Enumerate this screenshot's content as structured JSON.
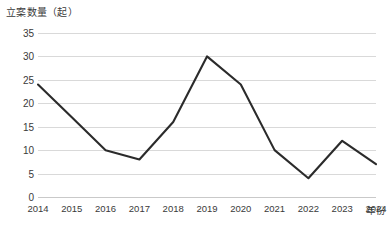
{
  "chart_data": {
    "type": "line",
    "title": "",
    "ylabel": "立案数量（起）",
    "xlabel": "年份",
    "categories": [
      "2014",
      "2015",
      "2016",
      "2017",
      "2018",
      "2019",
      "2020",
      "2021",
      "2022",
      "2023",
      "2024"
    ],
    "series": [
      {
        "name": "立案数量",
        "values": [
          24,
          17,
          10,
          8,
          16,
          30,
          24,
          10,
          4,
          12,
          7
        ],
        "color": "#2b2b2b"
      }
    ],
    "ylim": [
      0,
      35
    ],
    "ytick_step": 5,
    "yticks": [
      0,
      5,
      10,
      15,
      20,
      25,
      30,
      35
    ],
    "grid": "horizontal",
    "legend": "none",
    "line_color": "#2b2b2b",
    "gridline_color": "#d9d9d9",
    "background_color": "#ffffff",
    "markers": "none"
  }
}
